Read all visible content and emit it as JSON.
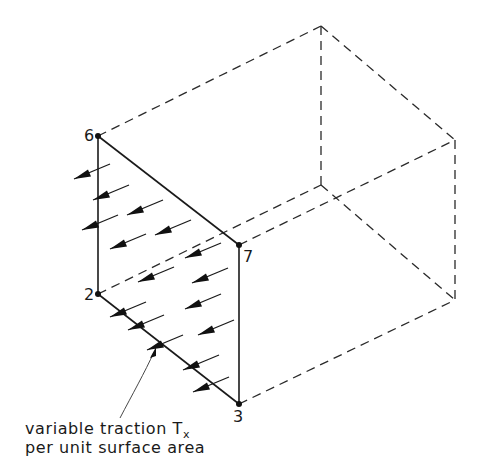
{
  "figure": {
    "node_labels": {
      "n6": "6",
      "n7": "7",
      "n2": "2",
      "n3": "3"
    },
    "caption": {
      "line1_prefix": "variable traction T",
      "line1_subscript": "x",
      "line2": "per unit surface area"
    },
    "colors": {
      "ink": "#1a1a1a",
      "background": "#ffffff"
    },
    "vertices": {
      "n6": [
        98,
        136
      ],
      "n7": [
        239,
        245
      ],
      "n2": [
        98,
        294
      ],
      "n3": [
        239,
        404
      ],
      "back_top": [
        321,
        26
      ],
      "back_right_top": [
        455,
        140
      ],
      "back_inner": [
        321,
        185
      ],
      "back_right_bottom": [
        455,
        300
      ]
    },
    "traction_arrow_count": 17
  }
}
